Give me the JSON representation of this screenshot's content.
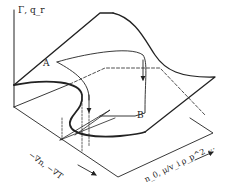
{
  "diagram": {
    "axes": {
      "vertical": "Γ, q_r",
      "horizontal_left": "−∇n, −∇T",
      "horizontal_right": "n_0, μ/v_i ρ_p^2 ..."
    },
    "points": {
      "A": "A",
      "B": "B"
    },
    "colors": {
      "line": "#222222",
      "background": "#ffffff"
    }
  }
}
